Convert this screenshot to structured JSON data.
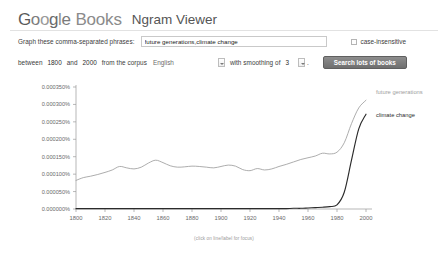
{
  "header": {
    "logo_letters": [
      "G",
      "o",
      "o",
      "g",
      "l",
      "e"
    ],
    "books_word": "Books",
    "product_name": "Ngram Viewer"
  },
  "form": {
    "phrases_label": "Graph these comma-separated phrases:",
    "phrases_value": "future generations,climate change",
    "phrases_placeholder": "",
    "case_insensitive_label": "case-insensitive",
    "between_label": "between",
    "start_year": "1800",
    "and_label": "and",
    "end_year": "2000",
    "corpus_label": "from the corpus",
    "corpus_value": "English",
    "smoothing_label": "with smoothing of",
    "smoothing_value": "3",
    "period": ".",
    "search_button_label": "Search lots of books"
  },
  "chart_data": {
    "type": "line",
    "title": "",
    "xlabel": "",
    "ylabel": "",
    "caption": "(click on line/label for focus)",
    "xlim": [
      1800,
      2000
    ],
    "ylim": [
      0.0,
      0.00035
    ],
    "grid": false,
    "legend_position": "inline-right",
    "xticks": [
      1800,
      1820,
      1840,
      1860,
      1880,
      1900,
      1920,
      1940,
      1960,
      1980,
      2000
    ],
    "xtick_labels": [
      "1800",
      "1820",
      "1840",
      "1860",
      "1880",
      "1900",
      "1920",
      "1940",
      "1960",
      "1980",
      "2000"
    ],
    "yticks": [
      0.0,
      5e-05,
      0.0001,
      0.00015,
      0.0002,
      0.00025,
      0.0003,
      0.00035
    ],
    "ytick_labels": [
      "0.000000%",
      "0.000050%",
      "0.000100%",
      "0.000150%",
      "0.000200%",
      "0.000250%",
      "0.000300%",
      "0.000350%"
    ],
    "x": [
      1800,
      1805,
      1810,
      1815,
      1820,
      1825,
      1830,
      1835,
      1840,
      1845,
      1850,
      1855,
      1860,
      1865,
      1870,
      1875,
      1880,
      1885,
      1890,
      1895,
      1900,
      1905,
      1910,
      1915,
      1920,
      1925,
      1930,
      1935,
      1940,
      1945,
      1950,
      1955,
      1960,
      1965,
      1970,
      1975,
      1980,
      1985,
      1990,
      1995,
      2000
    ],
    "series": [
      {
        "name": "future generations",
        "color": "#9e9e9e",
        "values": [
          8.2e-05,
          9e-05,
          9.4e-05,
          9.9e-05,
          0.000105,
          0.000112,
          0.000122,
          0.000118,
          0.000115,
          0.00012,
          0.000132,
          0.00014,
          0.000133,
          0.000124,
          0.00012,
          0.000121,
          0.000123,
          0.000122,
          0.00012,
          0.000118,
          0.000122,
          0.000126,
          0.000123,
          0.000113,
          0.00011,
          0.000116,
          0.000112,
          0.000115,
          0.000122,
          0.000128,
          0.000135,
          0.000142,
          0.000147,
          0.000152,
          0.00016,
          0.000158,
          0.000163,
          0.00019,
          0.000245,
          0.00029,
          0.000312
        ]
      },
      {
        "name": "climate change",
        "color": "#2b2b2b",
        "values": [
          1e-06,
          1e-06,
          1e-06,
          1e-06,
          1e-06,
          1e-06,
          1e-06,
          1e-06,
          1e-06,
          1e-06,
          1e-06,
          1e-06,
          1e-06,
          1e-06,
          1e-06,
          1e-06,
          1e-06,
          1e-06,
          1e-06,
          1e-06,
          1e-06,
          1e-06,
          1e-06,
          1e-06,
          1e-06,
          1e-06,
          1e-06,
          1e-06,
          1e-06,
          1e-06,
          2e-06,
          2e-06,
          3e-06,
          4e-06,
          5e-06,
          7e-06,
          1.2e-05,
          4.8e-05,
          0.00014,
          0.00023,
          0.000272
        ]
      }
    ]
  }
}
